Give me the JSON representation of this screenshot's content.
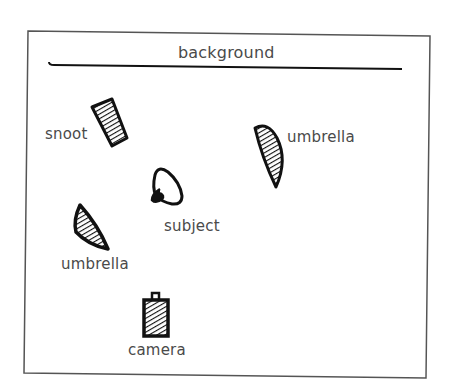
{
  "diagram": {
    "colors": {
      "ink": "#111111",
      "label": "#4a4a4a",
      "frame": "#555555",
      "paper": "#ffffff"
    },
    "elements": [
      {
        "id": "background",
        "label": "background",
        "icon": "background-line-icon"
      },
      {
        "id": "snoot",
        "label": "snoot",
        "icon": "snoot-icon"
      },
      {
        "id": "umbrella-right",
        "label": "umbrella",
        "icon": "umbrella-icon"
      },
      {
        "id": "subject",
        "label": "subject",
        "icon": "subject-head-icon"
      },
      {
        "id": "umbrella-left",
        "label": "umbrella",
        "icon": "umbrella-icon"
      },
      {
        "id": "camera",
        "label": "camera",
        "icon": "camera-icon"
      }
    ]
  }
}
